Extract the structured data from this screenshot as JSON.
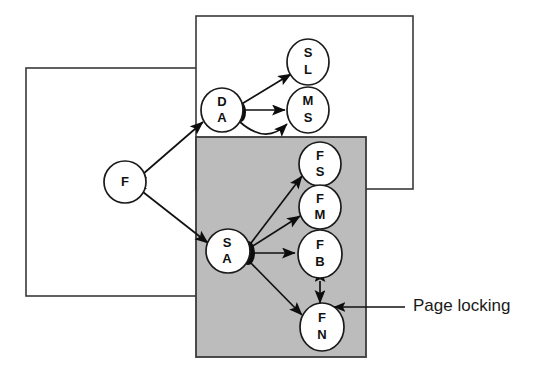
{
  "figure": {
    "type": "architecture-layer-diagram",
    "background_color": "#ffffff",
    "stroke_color": "#111111",
    "shaded_fill": "#bcbcbc"
  },
  "annotations": [
    {
      "id": "page-locking",
      "label": "Page locking",
      "pointer": "arrow-left",
      "target": "shaded-region"
    }
  ],
  "regions": [
    {
      "id": "left-frame",
      "label": "",
      "x": 26,
      "y": 68,
      "width": 196,
      "height": 228,
      "fill": "#ffffff"
    },
    {
      "id": "top-frame",
      "label": "",
      "x": 196,
      "y": 16,
      "width": 217,
      "height": 173,
      "fill": "#ffffff"
    },
    {
      "id": "shaded-region",
      "label": "",
      "x": 196,
      "y": 137,
      "width": 170,
      "height": 220,
      "fill": "#bcbcbc"
    }
  ],
  "nodes": [
    {
      "id": "F",
      "lines": [
        "F"
      ],
      "cx": 125,
      "cy": 182,
      "rx": 21,
      "ry": 21
    },
    {
      "id": "DA",
      "lines": [
        "D",
        "A"
      ],
      "cx": 222,
      "cy": 110,
      "rx": 21,
      "ry": 22
    },
    {
      "id": "SL",
      "lines": [
        "S",
        "L"
      ],
      "cx": 308,
      "cy": 62,
      "rx": 21,
      "ry": 23
    },
    {
      "id": "MS",
      "lines": [
        "M",
        "S"
      ],
      "cx": 308,
      "cy": 110,
      "rx": 21,
      "ry": 23
    },
    {
      "id": "SA",
      "lines": [
        "S",
        "A"
      ],
      "cx": 228,
      "cy": 251,
      "rx": 22,
      "ry": 22
    },
    {
      "id": "FS",
      "lines": [
        "F",
        "S"
      ],
      "cx": 320,
      "cy": 164,
      "rx": 21,
      "ry": 22
    },
    {
      "id": "FM",
      "lines": [
        "F",
        "M"
      ],
      "cx": 320,
      "cy": 207,
      "rx": 21,
      "ry": 22
    },
    {
      "id": "FB",
      "lines": [
        "F",
        "B"
      ],
      "cx": 320,
      "cy": 254,
      "rx": 22,
      "ry": 24
    },
    {
      "id": "FN",
      "lines": [
        "F",
        "N"
      ],
      "cx": 322,
      "cy": 327,
      "rx": 22,
      "ry": 24
    }
  ],
  "edges": [
    {
      "from": "F",
      "to": "DA",
      "arrows": "both"
    },
    {
      "from": "F",
      "to": "SA",
      "arrows": "both"
    },
    {
      "from": "DA",
      "to": "SL",
      "arrows": "both"
    },
    {
      "from": "DA",
      "to": "MS",
      "arrows": "forward"
    },
    {
      "from": "MS",
      "to": "DA",
      "arrows": "forward",
      "shape": "curved"
    },
    {
      "from": "SA",
      "to": "FS",
      "arrows": "forward"
    },
    {
      "from": "SA",
      "to": "FM",
      "arrows": "forward"
    },
    {
      "from": "SA",
      "to": "FB",
      "arrows": "forward"
    },
    {
      "from": "SA",
      "to": "FN",
      "arrows": "forward"
    },
    {
      "from": "FB",
      "to": "FN",
      "arrows": "both"
    }
  ]
}
